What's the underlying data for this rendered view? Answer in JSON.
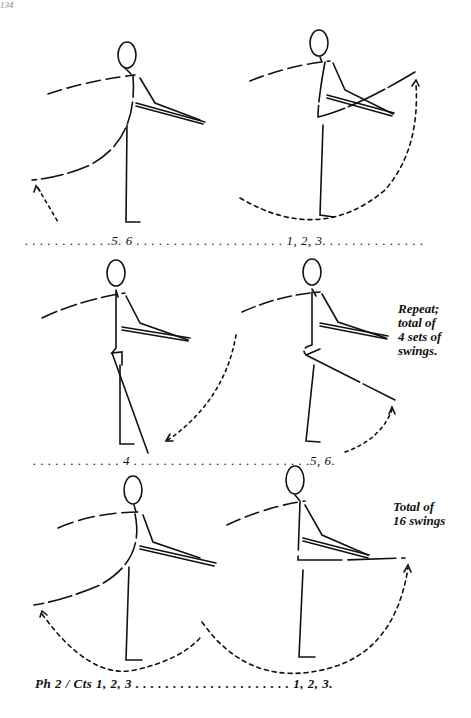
{
  "page": {
    "page_number": "134"
  },
  "rows": [
    {
      "count_line": ". . . . . . . . . . . .5. 6 . . . . . . . . . . . . . . . . . . . . 1, 2, 3. . . . . . . . . . . . . .",
      "note": null
    },
    {
      "count_line": ". . . . . . . . . . . . 4 . . . . . . . . . . . . . . . . . . . . . . . .5, 6.",
      "note": [
        "Repeat;",
        "total of",
        "4 sets of",
        "swings."
      ]
    },
    {
      "count_line": "Ph 2 / Cts 1, 2, 3 . . . . . . . . . . . . . . . . . . . . . 1, 2, 3.",
      "note": [
        "Total of",
        "16 swings"
      ]
    }
  ],
  "figures": [
    {
      "row": 1,
      "position": "left",
      "description": "stick figure at barre, working leg swung back with dashed arrow"
    },
    {
      "row": 1,
      "position": "right",
      "description": "stick figure at barre, leg swung forward high, dashed arc arrow"
    },
    {
      "row": 2,
      "position": "left",
      "description": "stick figure, leg crossed in front at count 4"
    },
    {
      "row": 2,
      "position": "right",
      "description": "stick figure, leg extended diagonally back, dotted arrow"
    },
    {
      "row": 3,
      "position": "left",
      "description": "stick figure, leg swung back, dotted arc arrow"
    },
    {
      "row": 3,
      "position": "right",
      "description": "stick figure, leg extended forward horizontally, dotted arc arrow"
    }
  ],
  "colors": {
    "ink": "#111111",
    "background": "#ffffff"
  }
}
